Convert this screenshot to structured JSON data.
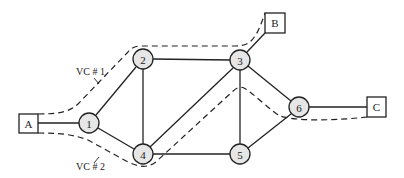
{
  "diagram": {
    "hosts": [
      {
        "id": "A",
        "label": "A"
      },
      {
        "id": "B",
        "label": "B"
      },
      {
        "id": "C",
        "label": "C"
      }
    ],
    "nodes": [
      {
        "id": "1",
        "label": "1"
      },
      {
        "id": "2",
        "label": "2"
      },
      {
        "id": "3",
        "label": "3"
      },
      {
        "id": "4",
        "label": "4"
      },
      {
        "id": "5",
        "label": "5"
      },
      {
        "id": "6",
        "label": "6"
      }
    ],
    "links": [
      [
        "A",
        "1"
      ],
      [
        "1",
        "2"
      ],
      [
        "1",
        "4"
      ],
      [
        "2",
        "3"
      ],
      [
        "2",
        "4"
      ],
      [
        "3",
        "4"
      ],
      [
        "3",
        "5"
      ],
      [
        "3",
        "6"
      ],
      [
        "3",
        "B"
      ],
      [
        "4",
        "5"
      ],
      [
        "5",
        "6"
      ],
      [
        "6",
        "C"
      ]
    ],
    "virtual_circuits": [
      {
        "label": "VC # 1",
        "path": [
          "A",
          "1",
          "2",
          "3",
          "B"
        ]
      },
      {
        "label": "VC # 2",
        "path": [
          "A",
          "1",
          "4",
          "3",
          "6",
          "C"
        ]
      }
    ],
    "colors": {
      "line": "#222222",
      "node_fill": "#e6e6e6",
      "host_fill": "#ffffff",
      "background": "#ffffff"
    }
  }
}
